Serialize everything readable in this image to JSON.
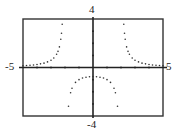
{
  "chart_data": {
    "type": "scatter",
    "title": "",
    "xlabel": "",
    "ylabel": "",
    "xlim": [
      -5,
      5
    ],
    "ylim": [
      -4,
      4
    ],
    "tick_labels": {
      "x_min": "-5",
      "x_max": "5",
      "y_max": "4",
      "y_min": "-4"
    },
    "x_ticks": [
      -4,
      -3,
      -2,
      -1,
      1,
      2,
      3,
      4
    ],
    "y_ticks": [
      -3,
      -2,
      -1,
      1,
      2,
      3
    ],
    "grid": false,
    "legend": null,
    "function": "y = 3/(x^2 - 4)",
    "vertical_asymptotes": [
      -2,
      2
    ],
    "series": [
      {
        "name": "left branch",
        "x": [
          -5,
          -4.75,
          -4.5,
          -4.25,
          -4,
          -3.75,
          -3.5,
          -3.25,
          -3,
          -2.8,
          -2.6,
          -2.5,
          -2.4,
          -2.3,
          -2.25,
          -2.2
        ],
        "y": [
          0.14,
          0.16,
          0.19,
          0.21,
          0.25,
          0.3,
          0.36,
          0.46,
          0.6,
          0.78,
          1.09,
          1.33,
          1.7,
          2.33,
          2.82,
          3.57
        ]
      },
      {
        "name": "middle branch",
        "x": [
          -1.75,
          -1.6,
          -1.5,
          -1.25,
          -1,
          -0.75,
          -0.5,
          -0.25,
          0,
          0.25,
          0.5,
          0.75,
          1,
          1.25,
          1.5,
          1.6,
          1.75
        ],
        "y": [
          -3.2,
          -2.08,
          -1.71,
          -1.23,
          -1.0,
          -0.87,
          -0.8,
          -0.76,
          -0.75,
          -0.76,
          -0.8,
          -0.87,
          -1.0,
          -1.23,
          -1.71,
          -2.08,
          -3.2
        ]
      },
      {
        "name": "right branch",
        "x": [
          2.2,
          2.25,
          2.3,
          2.4,
          2.5,
          2.6,
          2.8,
          3,
          3.25,
          3.5,
          3.75,
          4,
          4.25,
          4.5,
          4.75,
          5
        ],
        "y": [
          3.57,
          2.82,
          2.33,
          1.7,
          1.33,
          1.09,
          0.78,
          0.6,
          0.46,
          0.36,
          0.3,
          0.25,
          0.21,
          0.19,
          0.16,
          0.14
        ]
      }
    ]
  },
  "colors": {
    "axis": "#222222",
    "frame": "#333333",
    "points": "#333333",
    "background": "#ffffff"
  }
}
